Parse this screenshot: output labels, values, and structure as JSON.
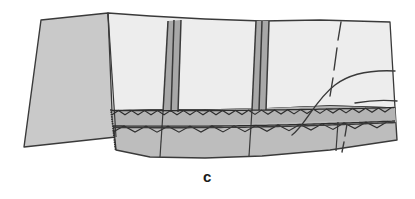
{
  "figure": {
    "caption": "c",
    "label_type": "sub-figure-letter",
    "canvas": {
      "width": 415,
      "height": 199,
      "background": "#ffffff"
    }
  },
  "colors": {
    "background": "#ffffff",
    "left_panel_fill": "#c9c9c9",
    "upper_panel_fill": "#ededed",
    "lower_band_fill": "#bdbdbd",
    "mid_strip_fill": "#b4b4b4",
    "seam_fold_fill": "#a8a8a8",
    "outline": "#3a3a3a",
    "stitch_line": "#2e2e2e",
    "caption_color": "#1a1a1a"
  },
  "parts": {
    "left_panel": {
      "name": "left facing panel",
      "fill": "#c9c9c9",
      "points": "41,20 108,13 116,137 24,147"
    },
    "upper_panel": {
      "name": "upper main fabric panel",
      "fill": "#ededed",
      "points": "108,13 150,16 205,19 262,21 320,20 390,22 395,108 330,106 262,109 205,110 150,110 112,111"
    },
    "lower_band": {
      "name": "lower waistband band",
      "fill": "#bdbdbd",
      "points": "112,111 150,110 205,110 262,109 330,106 395,108 397,140 330,150 262,156 205,158 150,157 116,150"
    },
    "mid_strip": {
      "name": "upper stitched strip",
      "fill": "#b4b4b4",
      "points": "112,111 205,110 330,106 395,108 396,122 330,121 205,125 113,126"
    }
  },
  "seams": [
    {
      "name": "left pleat seam",
      "type": "triple-line-fold",
      "lines": [
        "168,21 163,112",
        "174,20 171,112",
        "181,20 178,112"
      ],
      "fill": "168,21 181,20 178,112 163,112"
    },
    {
      "name": "right pleat seam",
      "type": "triple-line-fold",
      "lines": [
        "256,21 252,110",
        "262,21 259,110",
        "269,21 266,110"
      ],
      "fill": "256,21 269,21 266,110 252,110"
    }
  ],
  "stitching": {
    "name": "zigzag overlock stitching",
    "rows": [
      {
        "id": "upper-zigzag",
        "description": "upper zigzag stitch row along strip"
      },
      {
        "id": "lower-zigzag",
        "description": "lower zigzag stitch row along band"
      }
    ],
    "edge_bead_line": {
      "description": "beaded vertical edge finish at left of band",
      "x": 111,
      "y_top": 110,
      "y_bottom": 150
    }
  },
  "guides": {
    "dashed_line": {
      "name": "dashed center guideline",
      "style": "dashed",
      "segments": [
        "341,22 338,40",
        "337,48 334,70",
        "333,78 330,96",
        "347,124 345,136",
        "344,142 342,152"
      ]
    },
    "curve": {
      "name": "swept curve line",
      "path": "M 292,135 C 305,126 315,100 335,85 C 352,72 375,70 395,71"
    },
    "second_curve": {
      "name": "lower right curve tail",
      "path": "M 355,103 C 372,100 386,100 397,101"
    }
  },
  "dividers": [
    {
      "name": "band divider left",
      "line": "163,112 160,157"
    },
    {
      "name": "band divider right",
      "line": "252,110 249,156"
    },
    {
      "name": "band divider far right",
      "line": "338,122 336,151"
    },
    {
      "name": "panel left edge",
      "line": "108,13 116,137"
    }
  ]
}
